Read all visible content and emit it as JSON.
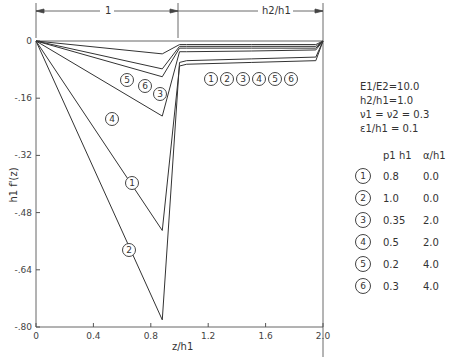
{
  "chart_data": {
    "type": "line",
    "title": "",
    "xlabel": "z/h1",
    "ylabel": "h1 f'(z)",
    "xlim": [
      0,
      2.0
    ],
    "ylim": [
      -0.8,
      0
    ],
    "x_ticks": [
      "0",
      "0.4",
      "0.8",
      "1.2",
      "1.6",
      "2.0"
    ],
    "y_ticks": [
      "0",
      "-.16",
      "-.32",
      "-.48",
      "-.64",
      "-.80"
    ],
    "top_annotations": {
      "region1": "1",
      "region2": "h2/h1"
    },
    "parameters": [
      "E1/E2=10.0",
      "h2/h1=1.0",
      "ν1 = ν2 = 0.3",
      "ε1/h1 = 0.1"
    ],
    "legend_headers": [
      "p1 h1",
      "α/h1"
    ],
    "series": [
      {
        "name": "1",
        "p1h1": "0.8",
        "alpha_h1": "0.0",
        "x": [
          0,
          0.88,
          1.0,
          1.05,
          1.5,
          1.95,
          2.0
        ],
        "y": [
          0,
          -0.53,
          -0.07,
          -0.065,
          -0.06,
          -0.055,
          0
        ]
      },
      {
        "name": "2",
        "p1h1": "1.0",
        "alpha_h1": "0.0",
        "x": [
          0,
          0.88,
          1.0,
          1.05,
          1.5,
          1.95,
          2.0
        ],
        "y": [
          0,
          -0.78,
          -0.06,
          -0.055,
          -0.05,
          -0.045,
          0
        ]
      },
      {
        "name": "3",
        "p1h1": "0.35",
        "alpha_h1": "2.0",
        "x": [
          0,
          0.88,
          1.0,
          1.05,
          1.5,
          1.95,
          2.0
        ],
        "y": [
          0,
          -0.1,
          -0.02,
          -0.02,
          -0.02,
          -0.02,
          0
        ]
      },
      {
        "name": "4",
        "p1h1": "0.5",
        "alpha_h1": "2.0",
        "x": [
          0,
          0.88,
          1.0,
          1.05,
          1.5,
          1.95,
          2.0
        ],
        "y": [
          0,
          -0.21,
          -0.03,
          -0.03,
          -0.028,
          -0.025,
          0
        ]
      },
      {
        "name": "5",
        "p1h1": "0.2",
        "alpha_h1": "4.0",
        "x": [
          0,
          0.88,
          1.0,
          1.05,
          1.5,
          1.95,
          2.0
        ],
        "y": [
          0,
          -0.036,
          -0.01,
          -0.01,
          -0.01,
          -0.01,
          0
        ]
      },
      {
        "name": "6",
        "p1h1": "0.3",
        "alpha_h1": "4.0",
        "x": [
          0,
          0.88,
          1.0,
          1.05,
          1.5,
          1.95,
          2.0
        ],
        "y": [
          0,
          -0.078,
          -0.015,
          -0.015,
          -0.015,
          -0.015,
          0
        ]
      }
    ],
    "grid": false,
    "legend_position": "right"
  }
}
